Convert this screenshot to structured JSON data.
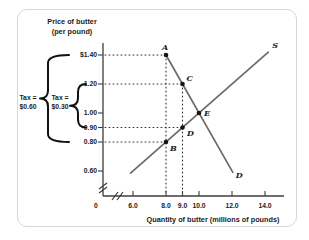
{
  "figure": {
    "kind": "supply-demand tax diagram"
  },
  "chart_data": {
    "type": "line",
    "title": "",
    "ylabel": "Price of butter (per pound)",
    "ylabel_lines": [
      "Price of butter",
      "(per pound)"
    ],
    "xlabel": "Quantity of butter (millions of pounds)",
    "x_origin_label": "0",
    "x_ticks": [
      {
        "label": "6.0",
        "q": 6
      },
      {
        "label": "8.0",
        "q": 8
      },
      {
        "label": "9.0",
        "q": 9
      },
      {
        "label": "10.0",
        "q": 10
      },
      {
        "label": "12.0",
        "q": 12
      },
      {
        "label": "14.0",
        "q": 14
      }
    ],
    "y_ticks": [
      {
        "label": "$1.40",
        "p": 1.4
      },
      {
        "label": "1.20",
        "p": 1.2
      },
      {
        "label": "1.00",
        "p": 1.0
      },
      {
        "label": "0.90",
        "p": 0.9
      },
      {
        "label": "0.80",
        "p": 0.8
      },
      {
        "label": "0.60",
        "p": 0.6
      }
    ],
    "xlim": [
      0,
      14.8
    ],
    "ylim": [
      0.5,
      1.5
    ],
    "axis_breaks": {
      "x": true,
      "y": true
    },
    "series": [
      {
        "name": "S",
        "role": "supply",
        "points": [
          [
            5.85,
            0.585
          ],
          [
            14.2,
            1.42
          ]
        ]
      },
      {
        "name": "D",
        "role": "demand",
        "points": [
          [
            8.0,
            1.4
          ],
          [
            12.05,
            0.59
          ]
        ]
      }
    ],
    "points": [
      {
        "name": "A",
        "q": 8,
        "p": 1.4
      },
      {
        "name": "C",
        "q": 9,
        "p": 1.2
      },
      {
        "name": "E",
        "q": 10,
        "p": 1.0
      },
      {
        "name": "D",
        "q": 9,
        "p": 0.9
      },
      {
        "name": "B",
        "q": 8,
        "p": 0.8
      }
    ],
    "equilibrium": {
      "name": "E",
      "q": 10,
      "p": 1.0
    },
    "guides": {
      "horizontal": [
        {
          "p": 1.4,
          "to_q": 8
        },
        {
          "p": 1.2,
          "to_q": 9
        },
        {
          "p": 0.9,
          "to_q": 9
        },
        {
          "p": 0.8,
          "to_q": 8
        }
      ],
      "vertical": [
        {
          "q": 8,
          "from_p": 1.4
        },
        {
          "q": 9,
          "from_p": 1.2
        }
      ]
    },
    "braces": [
      {
        "label_lines": [
          "Tax =",
          "$0.60"
        ],
        "from_p": 1.4,
        "to_p": 0.8
      },
      {
        "label_lines": [
          "Tax =",
          "$0.30"
        ],
        "from_p": 1.2,
        "to_p": 0.9
      }
    ],
    "colors": {
      "curve": "#6a6a6a",
      "dot": "#141414",
      "axis": "#3c3c3c",
      "guide": "#353535",
      "text": "#1c1c1c",
      "brace": "#111111",
      "card_border": "#cfd9de"
    }
  }
}
